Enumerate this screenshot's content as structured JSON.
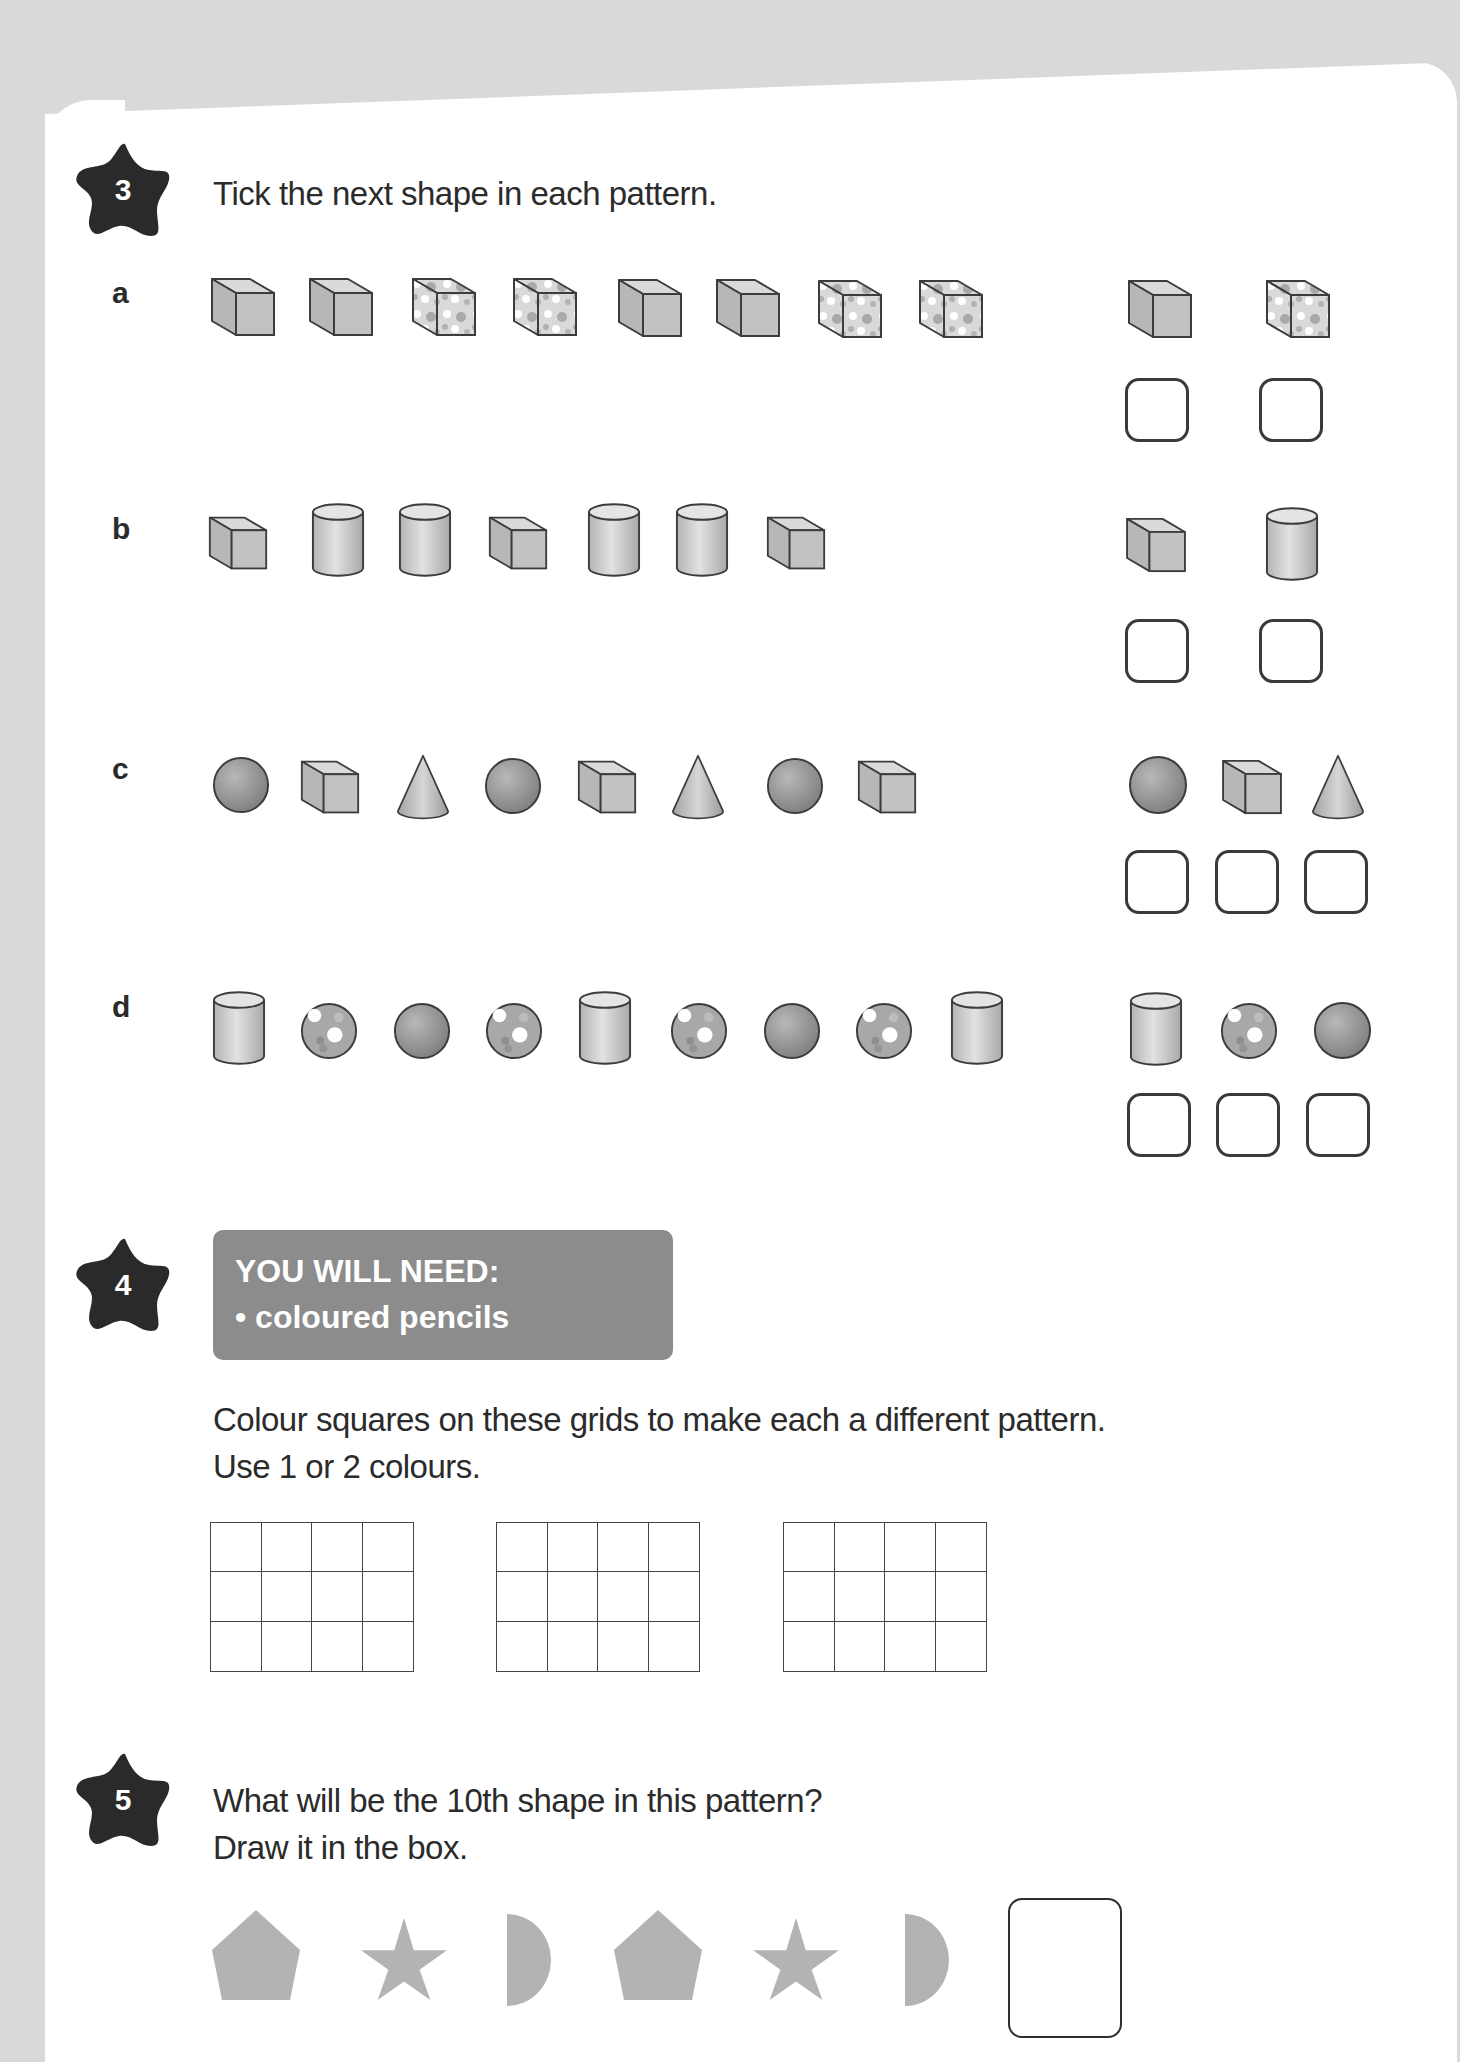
{
  "question3": {
    "number": "3",
    "prompt": "Tick the next shape in each pattern.",
    "rows": [
      {
        "label": "a",
        "sequence": [
          "plain-cube",
          "plain-cube",
          "spotted-cube",
          "spotted-cube",
          "plain-cube",
          "plain-cube",
          "spotted-cube",
          "spotted-cube"
        ],
        "options": [
          "plain-cube",
          "spotted-cube"
        ]
      },
      {
        "label": "b",
        "sequence": [
          "cube",
          "cylinder",
          "cylinder",
          "cube",
          "cylinder",
          "cylinder",
          "cube"
        ],
        "options": [
          "cube",
          "cylinder"
        ]
      },
      {
        "label": "c",
        "sequence": [
          "sphere",
          "cube",
          "cone",
          "sphere",
          "cube",
          "cone",
          "sphere",
          "cube"
        ],
        "options": [
          "sphere",
          "cube",
          "cone"
        ]
      },
      {
        "label": "d",
        "sequence": [
          "cylinder",
          "spotted-sphere",
          "plain-sphere",
          "spotted-sphere",
          "cylinder",
          "spotted-sphere",
          "plain-sphere",
          "spotted-sphere",
          "cylinder"
        ],
        "options": [
          "cylinder",
          "spotted-sphere",
          "plain-sphere"
        ]
      }
    ]
  },
  "question4": {
    "number": "4",
    "banner_title": "YOU WILL NEED:",
    "banner_item": "• coloured pencils",
    "instruction_line1": "Colour squares on these grids to make each a different pattern.",
    "instruction_line2": "Use 1 or 2 colours.",
    "grids": [
      {
        "rows": 3,
        "cols": 4
      },
      {
        "rows": 3,
        "cols": 4
      },
      {
        "rows": 3,
        "cols": 4
      }
    ]
  },
  "question5": {
    "number": "5",
    "prompt_line1": "What will be the 10th shape in this pattern?",
    "prompt_line2": "Draw it in the box.",
    "sequence": [
      "pentagon",
      "star",
      "semicircle",
      "pentagon",
      "star",
      "semicircle"
    ]
  },
  "colors": {
    "background": "#d9d9d9",
    "card": "#ffffff",
    "star_badge": "#2a2a2a",
    "banner": "#8c8c8c",
    "shape_fill": "#bdbdbd",
    "pattern_shape": "#b3b3b3"
  }
}
